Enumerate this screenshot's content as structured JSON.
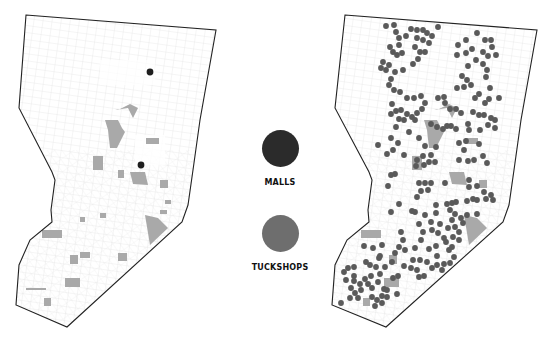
{
  "legend": {
    "items": [
      {
        "label": "MALLS",
        "color": "#2b2b2b",
        "icon": "mall-dot"
      },
      {
        "label": "TUCKSHOPS",
        "color": "#6e6e6e",
        "icon": "tuckshop-dot"
      }
    ]
  },
  "colors": {
    "outline": "#222222",
    "streets": "#d9d9d9",
    "land_use_patch": "#a9a9a9",
    "background": "#ffffff"
  },
  "maps": {
    "left": {
      "shows": "MALLS",
      "mall_points": [
        [
          150,
          72
        ],
        [
          141,
          165
        ]
      ]
    },
    "right": {
      "shows": "TUCKSHOPS"
    }
  }
}
